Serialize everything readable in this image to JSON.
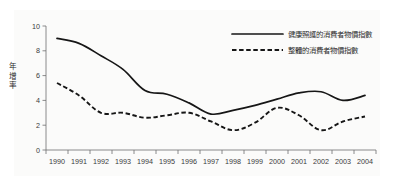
{
  "chart_data": {
    "type": "line",
    "title": "",
    "subtitle": "",
    "xlabel": "",
    "ylabel": "年增率",
    "ylabel_chars": [
      "年",
      "增",
      "率"
    ],
    "categories": [
      "1990",
      "1991",
      "1992",
      "1993",
      "1994",
      "1995",
      "1996",
      "1997",
      "1998",
      "1999",
      "2000",
      "2001",
      "2002",
      "2003",
      "2004"
    ],
    "yticks": [
      "0",
      "2",
      "4",
      "6",
      "8",
      "10"
    ],
    "ylim": [
      0,
      10
    ],
    "grid": false,
    "legend_position": "top-right",
    "series": [
      {
        "name": "健康照護的消費者物價指數",
        "style": "solid",
        "color": "#161616",
        "values": [
          9.0,
          8.6,
          7.6,
          6.5,
          4.8,
          4.5,
          3.8,
          2.9,
          3.2,
          3.6,
          4.1,
          4.6,
          4.7,
          4.0,
          4.4
        ]
      },
      {
        "name": "整體的消費者物價指數",
        "style": "dashed",
        "color": "#161616",
        "values": [
          5.4,
          4.4,
          3.0,
          3.0,
          2.6,
          2.8,
          3.0,
          2.3,
          1.6,
          2.2,
          3.4,
          2.8,
          1.6,
          2.3,
          2.7
        ]
      }
    ]
  },
  "legend": {
    "entries": [
      {
        "label": "健康照護的消費者物價指數"
      },
      {
        "label": "整體的消費者物價指數"
      }
    ]
  },
  "colors": {
    "line": "#161616",
    "axis": "#6e6e6e",
    "text": "#2b2b2b",
    "plot_background": "#fbfbfa",
    "figure_background": "#ffffff"
  }
}
